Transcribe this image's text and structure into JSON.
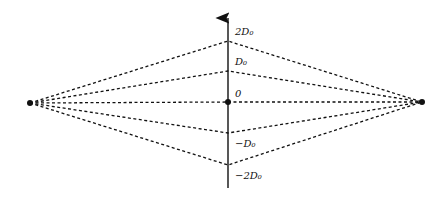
{
  "diagram": {
    "type": "ray-paths",
    "axis": {
      "x": 228,
      "y_top": 16,
      "y_bottom": 188,
      "arrow": "up"
    },
    "left_point": {
      "x": 30,
      "y": 103
    },
    "right_point": {
      "x": 422,
      "y": 102
    },
    "levels": [
      {
        "label": "2D₀",
        "y": 41
      },
      {
        "label": "D₀",
        "y": 71
      },
      {
        "label": "0",
        "y": 102
      },
      {
        "label": "−D₀",
        "y": 133
      },
      {
        "label": "−2D₀",
        "y": 165
      }
    ],
    "colors": {
      "line": "#111111",
      "background": "#ffffff"
    }
  }
}
